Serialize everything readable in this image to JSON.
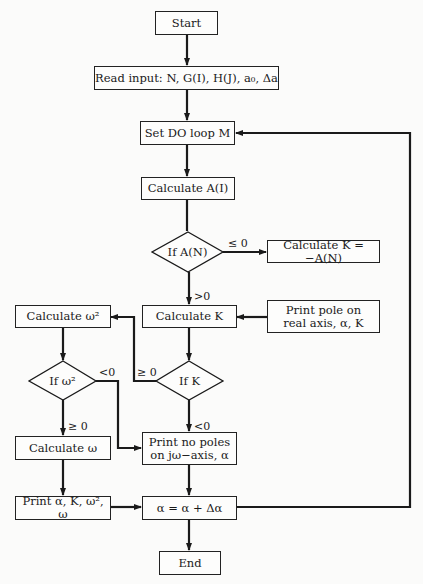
{
  "flowchart": {
    "nodes": {
      "start": "Start",
      "read_input": "Read input:  N, G(I), H(J), a₀,  Δa",
      "set_do_loop": "Set DO loop M",
      "calc_a": "Calculate A(I)",
      "if_an": "If A(N)",
      "calc_k_neg": "Calculate K = −A(N)",
      "calc_k": "Calculate K",
      "print_pole_line1": "Print pole on",
      "print_pole_line2": "real axis, α, K",
      "calc_w2": "Calculate ω²",
      "if_k": "If K",
      "if_w2": "If  ω²",
      "calc_w": "Calculate ω",
      "print_no_poles_line1": "Print no poles",
      "print_no_poles_line2": "on  jω−axis,  α",
      "print_results": "Print α, K, ω², ω",
      "increment": "α = α + Δα",
      "end": "End"
    },
    "edge_labels": {
      "an_le0": "≤ 0",
      "an_gt0": ">0",
      "k_ge0": "≥ 0",
      "k_lt0": "<0",
      "w2_lt0": "<0",
      "w2_ge0": "≥ 0"
    }
  }
}
